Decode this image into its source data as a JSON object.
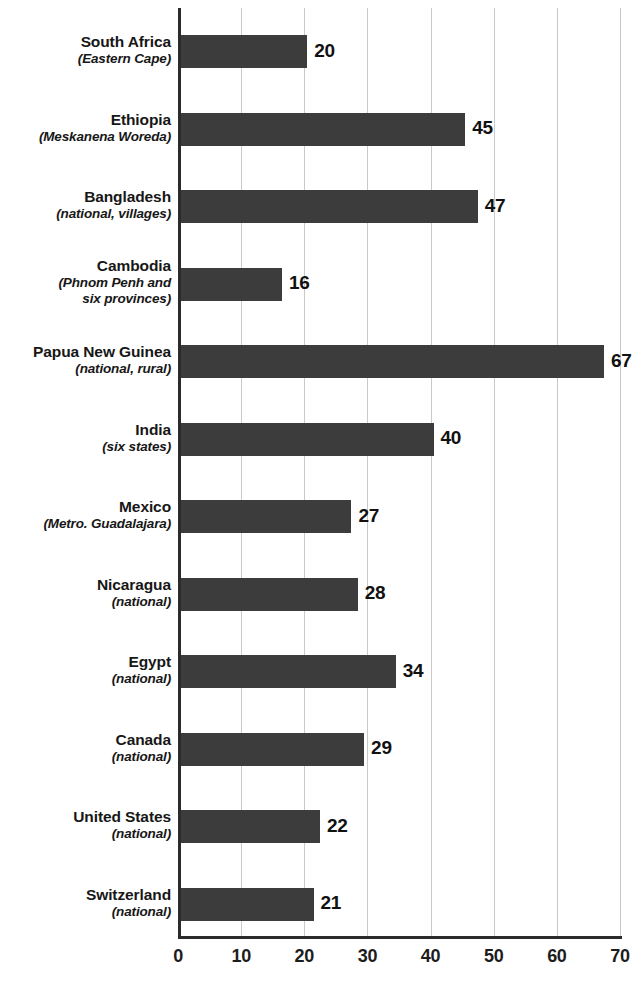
{
  "chart_data": {
    "type": "bar",
    "orientation": "horizontal",
    "title": "",
    "subtitle": "",
    "xlabel": "",
    "ylabel": "",
    "xlim": [
      0,
      70
    ],
    "ylim": null,
    "grid": "vertical",
    "legend": null,
    "bar_color": "#3c3c3c",
    "axis_color": "#2b2b2b",
    "gridline_color": "#c9c9c9",
    "xticks": [
      0,
      10,
      20,
      30,
      40,
      50,
      60,
      70
    ],
    "xtick_labels": [
      "0",
      "10",
      "20",
      "30",
      "40",
      "50",
      "60",
      "70"
    ],
    "categories": [
      "South Africa",
      "Ethiopia",
      "Bangladesh",
      "Cambodia",
      "Papua New Guinea",
      "India",
      "Mexico",
      "Nicaragua",
      "Egypt",
      "Canada",
      "United States",
      "Switzerland"
    ],
    "values": [
      20,
      45,
      47,
      16,
      67,
      40,
      27,
      28,
      34,
      29,
      22,
      21
    ],
    "bars": [
      {
        "name": "South Africa",
        "sublabel_lines": [
          "(Eastern Cape)"
        ],
        "value": 20,
        "value_label": "20"
      },
      {
        "name": "Ethiopia",
        "sublabel_lines": [
          "(Meskanena Woreda)"
        ],
        "value": 45,
        "value_label": "45"
      },
      {
        "name": "Bangladesh",
        "sublabel_lines": [
          "(national, villages)"
        ],
        "value": 47,
        "value_label": "47"
      },
      {
        "name": "Cambodia",
        "sublabel_lines": [
          "(Phnom Penh and",
          "six provinces)"
        ],
        "value": 16,
        "value_label": "16"
      },
      {
        "name": "Papua New Guinea",
        "sublabel_lines": [
          "(national, rural)"
        ],
        "value": 67,
        "value_label": "67"
      },
      {
        "name": "India",
        "sublabel_lines": [
          "(six states)"
        ],
        "value": 40,
        "value_label": "40"
      },
      {
        "name": "Mexico",
        "sublabel_lines": [
          "(Metro. Guadalajara)"
        ],
        "value": 27,
        "value_label": "27"
      },
      {
        "name": "Nicaragua",
        "sublabel_lines": [
          "(national)"
        ],
        "value": 28,
        "value_label": "28"
      },
      {
        "name": "Egypt",
        "sublabel_lines": [
          "(national)"
        ],
        "value": 34,
        "value_label": "34"
      },
      {
        "name": "Canada",
        "sublabel_lines": [
          "(national)"
        ],
        "value": 29,
        "value_label": "29"
      },
      {
        "name": "United States",
        "sublabel_lines": [
          "(national)"
        ],
        "value": 22,
        "value_label": "22"
      },
      {
        "name": "Switzerland",
        "sublabel_lines": [
          "(national)"
        ],
        "value": 21,
        "value_label": "21"
      }
    ]
  }
}
